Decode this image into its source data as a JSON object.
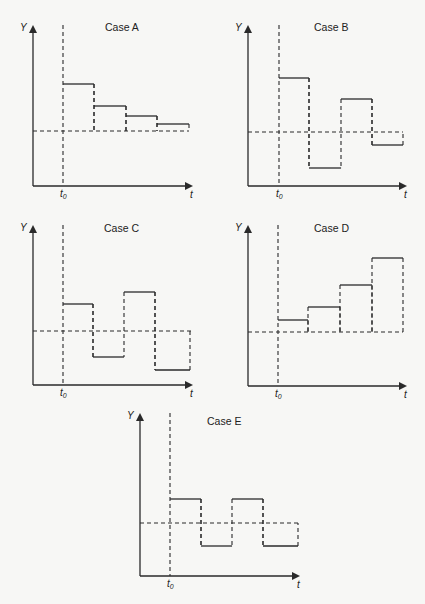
{
  "figure": {
    "axis_labels": {
      "y": "Y",
      "x": "t",
      "shock_time": "t",
      "shock_time_subscript": "0"
    }
  },
  "chart_data": [
    {
      "type": "line",
      "title": "Case A",
      "xlabel": "t",
      "ylabel": "Y",
      "annotation": "t0",
      "baseline_label": "equilibrium (dashed)",
      "x": [
        1,
        2,
        3,
        4
      ],
      "values": [
        1.0,
        0.55,
        0.33,
        0.15
      ],
      "pattern": "monotonic decay toward equilibrium from above"
    },
    {
      "type": "line",
      "title": "Case B",
      "xlabel": "t",
      "ylabel": "Y",
      "annotation": "t0",
      "x": [
        1,
        2,
        3,
        4
      ],
      "values": [
        1.0,
        -0.65,
        0.6,
        -0.24
      ],
      "pattern": "damped oscillation around equilibrium"
    },
    {
      "type": "line",
      "title": "Case C",
      "xlabel": "t",
      "ylabel": "Y",
      "annotation": "t0",
      "x": [
        1,
        2,
        3,
        4
      ],
      "values": [
        0.55,
        -0.55,
        0.8,
        -0.8
      ],
      "pattern": "explosive oscillation around equilibrium"
    },
    {
      "type": "line",
      "title": "Case D",
      "xlabel": "t",
      "ylabel": "Y",
      "annotation": "t0",
      "x": [
        1,
        2,
        3,
        4
      ],
      "values": [
        0.25,
        0.5,
        0.95,
        1.5
      ],
      "pattern": "explosive monotonic divergence above equilibrium"
    },
    {
      "type": "line",
      "title": "Case E",
      "xlabel": "t",
      "ylabel": "Y",
      "annotation": "t0",
      "x": [
        1,
        2,
        3,
        4
      ],
      "values": [
        0.5,
        -0.5,
        0.5,
        -0.5
      ],
      "pattern": "constant-amplitude oscillation around equilibrium"
    }
  ],
  "panels": [
    {
      "title": "Case A",
      "ox": 33,
      "top": 25,
      "bottom": 186,
      "right": 193,
      "t0": 63,
      "base": 131,
      "baseEnd": 189,
      "steps": [
        [
          63,
          94,
          84
        ],
        [
          94,
          126,
          106
        ],
        [
          126,
          157,
          116
        ],
        [
          157,
          189,
          124
        ]
      ],
      "titleX": 105,
      "titleY": 31
    },
    {
      "title": "Case B",
      "ox": 248,
      "top": 25,
      "bottom": 186,
      "right": 407,
      "t0": 279,
      "base": 132,
      "baseEnd": 403,
      "steps": [
        [
          279,
          309,
          78
        ],
        [
          309,
          341,
          168
        ],
        [
          341,
          372,
          99
        ],
        [
          372,
          403,
          145
        ]
      ],
      "titleX": 314,
      "titleY": 31
    },
    {
      "title": "Case C",
      "ox": 33,
      "top": 225,
      "bottom": 385,
      "right": 193,
      "t0": 63,
      "base": 331,
      "baseEnd": 193,
      "steps": [
        [
          63,
          93,
          304
        ],
        [
          93,
          124,
          357
        ],
        [
          124,
          155,
          292
        ],
        [
          155,
          190,
          370
        ]
      ],
      "titleX": 104,
      "titleY": 232
    },
    {
      "title": "Case D",
      "ox": 248,
      "top": 225,
      "bottom": 386,
      "right": 407,
      "t0": 278,
      "base": 332,
      "baseEnd": 403,
      "steps": [
        [
          278,
          308,
          320
        ],
        [
          308,
          340,
          307
        ],
        [
          340,
          372,
          285
        ],
        [
          372,
          403,
          258
        ]
      ],
      "titleX": 314,
      "titleY": 232
    },
    {
      "title": "Case E",
      "ox": 140,
      "top": 413,
      "bottom": 576,
      "right": 300,
      "t0": 170,
      "base": 523,
      "baseEnd": 298,
      "steps": [
        [
          170,
          201,
          499
        ],
        [
          201,
          232,
          546
        ],
        [
          232,
          263,
          499
        ],
        [
          263,
          298,
          546
        ]
      ],
      "titleX": 207,
      "titleY": 425
    }
  ]
}
